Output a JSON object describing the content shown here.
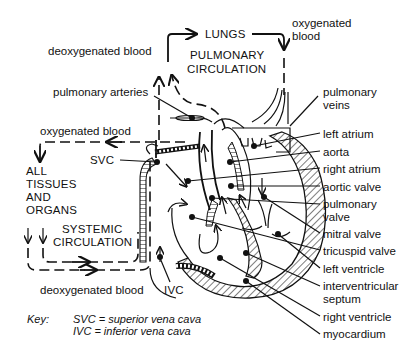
{
  "diagram": {
    "top": {
      "lungs": "LUNGS",
      "pulmonary_circulation_line1": "PULMONARY",
      "pulmonary_circulation_line2": "CIRCULATION",
      "deoxygenated_blood": "deoxygenated blood",
      "oxygenated_blood_line1": "oxygenated",
      "oxygenated_blood_line2": "blood",
      "pulmonary_arteries": "pulmonary arteries"
    },
    "left": {
      "oxygenated_blood": "oxygenated blood",
      "svc": "SVC",
      "tissues_line1": "ALL",
      "tissues_line2": "TISSUES",
      "tissues_line3": "AND",
      "tissues_line4": "ORGANS",
      "systemic_line1": "SYSTEMIC",
      "systemic_line2": "CIRCULATION",
      "deoxygenated_blood": "deoxygenated blood",
      "ivc": "IVC"
    },
    "right_labels": [
      {
        "id": "pulmonary-veins",
        "line1": "pulmonary",
        "line2": "veins"
      },
      {
        "id": "left-atrium",
        "line1": "left atrium"
      },
      {
        "id": "aorta",
        "line1": "aorta"
      },
      {
        "id": "right-atrium",
        "line1": "right atrium"
      },
      {
        "id": "aortic-valve",
        "line1": "aortic valve"
      },
      {
        "id": "pulmonary-valve",
        "line1": "pulmonary",
        "line2": "valve"
      },
      {
        "id": "mitral-valve",
        "line1": "mitral valve"
      },
      {
        "id": "tricuspid-valve",
        "line1": "tricuspid valve"
      },
      {
        "id": "left-ventricle",
        "line1": "left ventricle"
      },
      {
        "id": "interventricular-septum",
        "line1": "interventricular",
        "line2": "septum"
      },
      {
        "id": "right-ventricle",
        "line1": "right ventricle"
      },
      {
        "id": "myocardium",
        "line1": "myocardium"
      }
    ],
    "key": {
      "label": "Key:",
      "svc_def": "SVC = superior vena cava",
      "ivc_def": "IVC = inferior vena cava"
    }
  }
}
